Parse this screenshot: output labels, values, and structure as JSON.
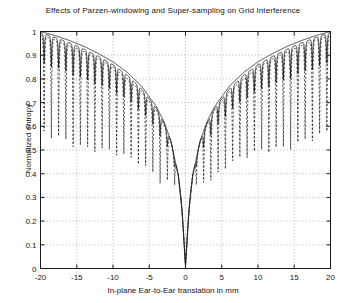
{
  "chart_data": {
    "type": "line",
    "title": "Effects of Parzen-windowing and Super-sampling on Grid Interference",
    "xlabel": "In-plane Ear-to-Ear translation in mm",
    "ylabel": "Normalized entropy",
    "xlim": [
      -20,
      20
    ],
    "ylim": [
      0,
      1
    ],
    "xticks": [
      -20,
      -15,
      -10,
      -5,
      0,
      5,
      10,
      15,
      20
    ],
    "xtick_labels": [
      "-20",
      "-15",
      "-10",
      "-5",
      "0",
      "5",
      "10",
      "15",
      "20"
    ],
    "yticks": [
      0,
      0.1,
      0.2,
      0.3,
      0.4,
      0.5,
      0.6,
      0.7,
      0.8,
      0.9,
      1
    ],
    "ytick_labels": [
      "0",
      "0.1",
      "0.2",
      "0.3",
      "0.4",
      "0.5",
      "0.6",
      "0.7",
      "0.8",
      "0.9",
      "1"
    ],
    "grid": true,
    "grid_style": "dotted",
    "legend": "none",
    "line_color": "#1a1a1a",
    "background": "#ffffff",
    "ripple_period_mm": 1.0,
    "series": [
      {
        "name": "no-windowing-no-supersampling",
        "style": "dashed",
        "description": "Deep grid-interference notches; ripple amplitude large, minima fall far below the envelope",
        "envelope_points": [
          {
            "x": -20,
            "y": 0.985
          },
          {
            "x": -18,
            "y": 0.965
          },
          {
            "x": -16,
            "y": 0.94
          },
          {
            "x": -14,
            "y": 0.915
          },
          {
            "x": -12,
            "y": 0.885
          },
          {
            "x": -10,
            "y": 0.85
          },
          {
            "x": -8,
            "y": 0.8
          },
          {
            "x": -6,
            "y": 0.745
          },
          {
            "x": -4,
            "y": 0.665
          },
          {
            "x": -3,
            "y": 0.61
          },
          {
            "x": -2,
            "y": 0.53
          },
          {
            "x": -1,
            "y": 0.4
          },
          {
            "x": -0.5,
            "y": 0.27
          },
          {
            "x": 0,
            "y": 0.015
          },
          {
            "x": 0.5,
            "y": 0.27
          },
          {
            "x": 1,
            "y": 0.4
          },
          {
            "x": 2,
            "y": 0.53
          },
          {
            "x": 3,
            "y": 0.61
          },
          {
            "x": 4,
            "y": 0.665
          },
          {
            "x": 6,
            "y": 0.745
          },
          {
            "x": 8,
            "y": 0.8
          },
          {
            "x": 10,
            "y": 0.85
          },
          {
            "x": 12,
            "y": 0.885
          },
          {
            "x": 14,
            "y": 0.915
          },
          {
            "x": 16,
            "y": 0.94
          },
          {
            "x": 18,
            "y": 0.965
          },
          {
            "x": 20,
            "y": 0.985
          }
        ],
        "notch_depth": 0.42
      },
      {
        "name": "parzen-windowed",
        "style": "solid",
        "description": "Reduced interference; shallower periodic notches riding on the envelope",
        "envelope_points": [
          {
            "x": -20,
            "y": 0.995
          },
          {
            "x": -18,
            "y": 0.975
          },
          {
            "x": -16,
            "y": 0.952
          },
          {
            "x": -14,
            "y": 0.925
          },
          {
            "x": -12,
            "y": 0.895
          },
          {
            "x": -10,
            "y": 0.86
          },
          {
            "x": -8,
            "y": 0.815
          },
          {
            "x": -6,
            "y": 0.755
          },
          {
            "x": -4,
            "y": 0.675
          },
          {
            "x": -3,
            "y": 0.615
          },
          {
            "x": -2,
            "y": 0.535
          },
          {
            "x": -1,
            "y": 0.395
          },
          {
            "x": -0.5,
            "y": 0.265
          },
          {
            "x": 0,
            "y": 0.012
          },
          {
            "x": 0.5,
            "y": 0.265
          },
          {
            "x": 1,
            "y": 0.395
          },
          {
            "x": 2,
            "y": 0.535
          },
          {
            "x": 3,
            "y": 0.615
          },
          {
            "x": 4,
            "y": 0.675
          },
          {
            "x": 6,
            "y": 0.755
          },
          {
            "x": 8,
            "y": 0.815
          },
          {
            "x": 10,
            "y": 0.86
          },
          {
            "x": 12,
            "y": 0.895
          },
          {
            "x": 14,
            "y": 0.925
          },
          {
            "x": 16,
            "y": 0.952
          },
          {
            "x": 18,
            "y": 0.975
          },
          {
            "x": 20,
            "y": 0.995
          }
        ],
        "notch_depth": 0.13
      },
      {
        "name": "parzen-windowed-and-super-sampled",
        "style": "solid",
        "description": "Smooth monotonic V-shaped curve, essentially free of grid interference",
        "envelope_points": [
          {
            "x": -20,
            "y": 1.0
          },
          {
            "x": -18,
            "y": 0.983
          },
          {
            "x": -16,
            "y": 0.962
          },
          {
            "x": -14,
            "y": 0.937
          },
          {
            "x": -12,
            "y": 0.907
          },
          {
            "x": -10,
            "y": 0.872
          },
          {
            "x": -8,
            "y": 0.827
          },
          {
            "x": -6,
            "y": 0.767
          },
          {
            "x": -4,
            "y": 0.682
          },
          {
            "x": -3,
            "y": 0.622
          },
          {
            "x": -2,
            "y": 0.537
          },
          {
            "x": -1,
            "y": 0.392
          },
          {
            "x": -0.5,
            "y": 0.252
          },
          {
            "x": 0,
            "y": 0.008
          },
          {
            "x": 0.5,
            "y": 0.252
          },
          {
            "x": 1,
            "y": 0.392
          },
          {
            "x": 2,
            "y": 0.537
          },
          {
            "x": 3,
            "y": 0.622
          },
          {
            "x": 4,
            "y": 0.682
          },
          {
            "x": 6,
            "y": 0.767
          },
          {
            "x": 8,
            "y": 0.827
          },
          {
            "x": 10,
            "y": 0.872
          },
          {
            "x": 12,
            "y": 0.907
          },
          {
            "x": 14,
            "y": 0.937
          },
          {
            "x": 16,
            "y": 0.962
          },
          {
            "x": 18,
            "y": 0.983
          },
          {
            "x": 20,
            "y": 1.0
          }
        ],
        "notch_depth": 0.0
      }
    ]
  }
}
